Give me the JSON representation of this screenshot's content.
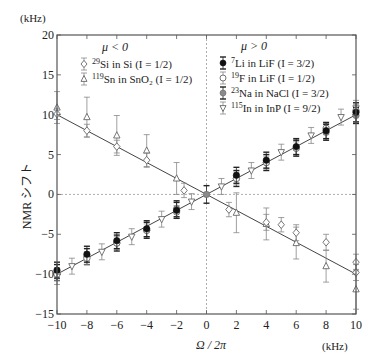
{
  "chart_data": {
    "type": "scatter",
    "title": "",
    "xlabel": "Ω / 2π",
    "x_unit": "(kHz)",
    "ylabel": "NMR シフト",
    "y_unit": "(kHz)",
    "xlim": [
      -10,
      10
    ],
    "ylim": [
      -15,
      20
    ],
    "x_ticks": [
      -10,
      -8,
      -6,
      -4,
      -2,
      0,
      2,
      4,
      6,
      8,
      10
    ],
    "y_ticks": [
      -15,
      -10,
      -5,
      0,
      5,
      10,
      15,
      20
    ],
    "reference_lines": [
      {
        "orientation": "horizontal",
        "value": 0,
        "style": "dotted"
      },
      {
        "orientation": "vertical",
        "value": 0,
        "style": "dotted"
      }
    ],
    "fit_lines": [
      {
        "name": "μ<0 fit",
        "x": [
          -10,
          10
        ],
        "y": [
          10,
          -10
        ]
      },
      {
        "name": "μ>0 fit",
        "x": [
          -10,
          10
        ],
        "y": [
          -10,
          10
        ]
      }
    ],
    "legend_groups": [
      {
        "heading": "μ < 0",
        "position": "upper-left",
        "entries": [
          {
            "label": "29Si in Si (I = 1/2)",
            "sup": "29",
            "text": "Si in Si (I = 1/2)",
            "marker": "diamond-open"
          },
          {
            "label": "119Sn in SnO2 (I = 1/2)",
            "sup": "119",
            "text": "Sn in SnO₂ (I = 1/2)",
            "marker": "triangle-open"
          }
        ]
      },
      {
        "heading": "μ > 0",
        "position": "upper-right",
        "entries": [
          {
            "label": "7Li in LiF (I = 3/2)",
            "sup": "7",
            "text": "Li in LiF (I = 3/2)",
            "marker": "circle-filled"
          },
          {
            "label": "19F in LiF (I = 1/2)",
            "sup": "19",
            "text": "F in LiF (I = 1/2)",
            "marker": "circle-open"
          },
          {
            "label": "23Na in NaCl (I = 3/2)",
            "sup": "23",
            "text": "Na in NaCl (I = 3/2)",
            "marker": "circle-gray"
          },
          {
            "label": "115In in InP (I = 9/2)",
            "sup": "115",
            "text": "In in InP (I = 9/2)",
            "marker": "triangle-down-open"
          }
        ]
      }
    ],
    "series": [
      {
        "name": "29Si in Si (I=1/2)",
        "group": "μ<0",
        "marker": "diamond-open",
        "x": [
          -10,
          -8,
          -6,
          -4,
          -1.5,
          1.5,
          4,
          5,
          6,
          8,
          10,
          10
        ],
        "y": [
          10.1,
          8.0,
          6.0,
          4.3,
          0.5,
          -1.9,
          -3.5,
          -3.8,
          -4.8,
          -6.0,
          -8.5,
          -9.8
        ],
        "err": [
          0.7,
          0.8,
          0.8,
          0.9,
          0.9,
          0.9,
          1.0,
          0.9,
          1.0,
          1.0,
          1.0,
          1.0
        ]
      },
      {
        "name": "119Sn in SnO2 (I=1/2)",
        "group": "μ<0",
        "marker": "triangle-open",
        "x": [
          -10,
          -8,
          -6,
          -4,
          -2,
          2,
          4,
          6,
          8,
          10
        ],
        "y": [
          10.9,
          9.7,
          7.4,
          5.5,
          2.0,
          -2.3,
          -3.7,
          -6.1,
          -9.0,
          -11.9
        ],
        "err": [
          2.0,
          2.5,
          2.5,
          2.0,
          2.0,
          2.5,
          2.0,
          2.0,
          2.0,
          2.5
        ]
      },
      {
        "name": "7Li in LiF (I=3/2)",
        "group": "μ>0",
        "marker": "circle-filled",
        "x": [
          -10,
          -8,
          -6,
          -4,
          -2,
          2,
          4,
          6,
          8,
          10
        ],
        "y": [
          -9.5,
          -7.5,
          -5.8,
          -4.3,
          -2.0,
          2.4,
          4.3,
          6.0,
          8.0,
          10.3
        ],
        "err": [
          1.0,
          1.0,
          1.0,
          1.0,
          1.0,
          1.0,
          1.0,
          1.0,
          1.0,
          1.2
        ]
      },
      {
        "name": "19F in LiF (I=1/2)",
        "group": "μ>0",
        "marker": "circle-open",
        "x": [
          -10,
          -8,
          -6,
          -4,
          -2,
          2,
          4,
          6,
          8,
          10
        ],
        "y": [
          -10.0,
          -8.0,
          -6.1,
          -4.5,
          -2.2,
          2.0,
          4.0,
          5.8,
          8.3,
          10.5
        ],
        "err": [
          0.8,
          0.8,
          0.8,
          0.8,
          0.8,
          0.8,
          0.8,
          0.8,
          0.8,
          0.8
        ]
      },
      {
        "name": "23Na in NaCl (I=3/2)",
        "group": "μ>0",
        "marker": "circle-gray",
        "x": [
          -10,
          -8,
          -6,
          -4,
          -2,
          0,
          2,
          4,
          6,
          8,
          10
        ],
        "y": [
          -9.8,
          -7.8,
          -6.1,
          -4.5,
          -1.8,
          0.0,
          2.0,
          4.0,
          5.8,
          7.8,
          9.9
        ],
        "err": [
          1.0,
          1.0,
          1.0,
          1.0,
          1.0,
          1.1,
          1.0,
          1.0,
          1.0,
          1.0,
          1.0
        ]
      },
      {
        "name": "115In in InP (I=9/2)",
        "group": "μ>0",
        "marker": "triangle-down-open",
        "x": [
          -10,
          -9,
          -7,
          -5,
          -3,
          -1,
          1,
          3,
          5,
          7,
          9,
          10
        ],
        "y": [
          -10.3,
          -9.0,
          -7.2,
          -5.3,
          -3.1,
          -0.9,
          1.0,
          3.0,
          5.3,
          7.4,
          9.7,
          10.8
        ],
        "err": [
          1.0,
          1.0,
          1.0,
          1.0,
          1.0,
          1.0,
          1.0,
          1.0,
          1.0,
          1.0,
          1.0,
          1.0
        ]
      }
    ],
    "colors": {
      "axis": "#555555",
      "fit_line": "#444444",
      "reference_line": "#999999",
      "error_bar_light": "#888888",
      "error_bar_dark": "#222222",
      "marker_filled": "#111111",
      "marker_gray": "#8a8a8a",
      "marker_open_fill": "#ffffff",
      "marker_stroke": "#666666"
    }
  }
}
